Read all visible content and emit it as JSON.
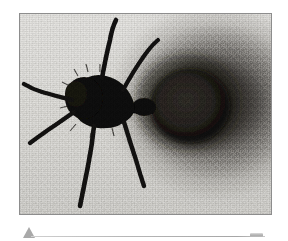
{
  "figure": {
    "kind": "photographic-plate",
    "frame": {
      "border_color": "#8d8d8d",
      "x": 19,
      "y": 13,
      "width": 253,
      "height": 202
    },
    "plate": {
      "background_color": "#dddcd8",
      "ink_color": "#151311",
      "halo_color": "#1c1916",
      "texture": "grainy-halftone-scan"
    },
    "anatomy": [
      {
        "name": "antenna-left",
        "label": "left antenna"
      },
      {
        "name": "antenna-right",
        "label": "right antenna"
      },
      {
        "name": "head",
        "label": "head"
      },
      {
        "name": "thorax",
        "label": "thorax"
      },
      {
        "name": "petiole",
        "label": "petiole / waist"
      },
      {
        "name": "abdomen",
        "label": "abdomen (gaster)"
      },
      {
        "name": "leg-front-left",
        "label": "front left leg"
      },
      {
        "name": "leg-mid-left",
        "label": "middle left leg"
      },
      {
        "name": "leg-hind-left",
        "label": "hind left leg"
      },
      {
        "name": "leg-right",
        "label": "right leg"
      },
      {
        "name": "spray-halo",
        "label": "defensive spray halo"
      }
    ]
  },
  "marker_row": {
    "triangle": {
      "color": "#9a9a9a",
      "direction": "up"
    },
    "rule": {
      "color": "#b6b6b6",
      "x": 31,
      "width": 234
    },
    "end_cap": {
      "color": "#a8a8a8"
    }
  },
  "page": {
    "background_color": "#ffffff",
    "width": 288,
    "height": 241
  }
}
